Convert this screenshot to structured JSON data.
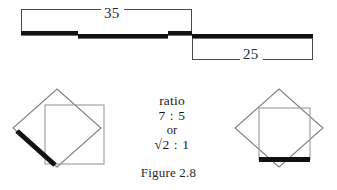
{
  "figure": {
    "caption": "Figure 2.8",
    "colors": {
      "thick_stroke": "#111111",
      "thin_stroke": "#808080",
      "bracket_stroke": "#4a4a4a",
      "text": "#2b2b2b",
      "background": "#ffffff"
    },
    "top_diagram": {
      "name": "stepped-bar-with-dimensions",
      "dimensions": [
        {
          "id": "upper",
          "label": "35",
          "position": "above",
          "span_start": 21,
          "span_end": 192
        },
        {
          "id": "lower",
          "label": "25",
          "position": "below",
          "span_start": 192,
          "span_end": 313
        }
      ],
      "bar_segments": [
        {
          "id": "segment-1",
          "x_start": 21,
          "x_end": 78,
          "y_top": 31
        },
        {
          "id": "segment-2",
          "x_start": 78,
          "x_end": 168,
          "y_top": 34
        },
        {
          "id": "segment-3",
          "x_start": 168,
          "x_end": 192,
          "y_top": 31
        },
        {
          "id": "segment-4",
          "x_start": 192,
          "x_end": 313,
          "y_top": 34
        }
      ]
    },
    "ratio_text": {
      "word": "ratio",
      "primary": "7 : 5",
      "conjunction": "or",
      "secondary": "√2 : 1"
    },
    "left_figure": {
      "name": "diamond-with-inscribed-square-diagonal-highlight",
      "diamond_points": "57,89 101,128 57,167 13,128",
      "square_points": "45,105 104,105 104,164 45,164",
      "highlight": {
        "x1": 17,
        "y1": 131,
        "x2": 55,
        "y2": 165
      }
    },
    "right_figure": {
      "name": "diamond-with-inscribed-square-base-highlight",
      "diamond_points": "279,89 323,128 279,167 235,128",
      "square_points": "259,108 310,108 310,160 259,160",
      "highlight": {
        "x1": 260,
        "y1": 160,
        "x2": 309,
        "y2": 160
      }
    }
  }
}
